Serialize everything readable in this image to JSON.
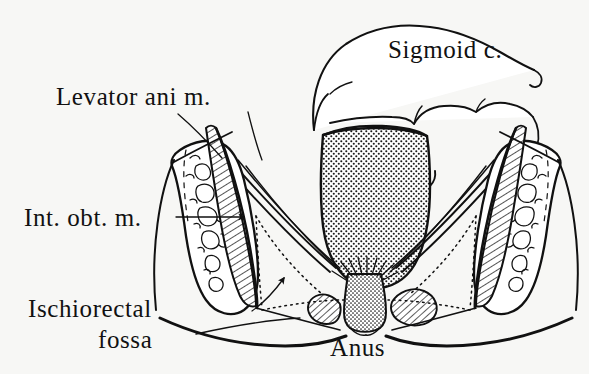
{
  "figure": {
    "style": "hand-drawn anatomical line illustration, black ink on off-white paper",
    "background_color": "#f7f7f5",
    "ink_color": "#111111",
    "width": 589,
    "height": 374
  },
  "labels": {
    "sigmoid": "Sigmoid c.",
    "levator": "Levator ani m.",
    "obturator": "Int. obt. m.",
    "fossa_line1": "Ischiorectal",
    "fossa_line2": "fossa",
    "anus": "Anus"
  },
  "structures": [
    {
      "name": "sigmoid-colon",
      "label": "Sigmoid c.",
      "texture": "outline",
      "description": "Loop of bowel arching over the top of the rectum with haustral indentations"
    },
    {
      "name": "rectal-ampulla",
      "label": "",
      "texture": "stipple",
      "description": "Large stippled oval cavity of the rectum occupying the midline"
    },
    {
      "name": "anal-canal",
      "label": "Anus",
      "texture": "stipple",
      "description": "Narrow stippled column descending from the rectum to the perineal skin"
    },
    {
      "name": "external-anal-sphincter",
      "label": "",
      "texture": "hatch",
      "description": "Paired hatched muscle bundles flanking the anal canal"
    },
    {
      "name": "levator-ani-muscle",
      "label": "Levator ani m.",
      "texture": "line-bands",
      "description": "Thin paired muscle sheets sloping from the pelvic wall down to the anorectal junction"
    },
    {
      "name": "obturator-internus-muscle",
      "label": "Int. obt. m.",
      "texture": "hatch",
      "description": "Diagonally hatched muscle band lying against the inner face of each ischium"
    },
    {
      "name": "ischium-left",
      "label": "",
      "texture": "trabecular",
      "description": "Left ischial bone shown in section with trabecular markings"
    },
    {
      "name": "ischium-right",
      "label": "",
      "texture": "trabecular",
      "description": "Right ischial bone shown in section with trabecular markings"
    },
    {
      "name": "ischiorectal-fossa",
      "label": "Ischiorectal fossa",
      "texture": "dotted-outline",
      "description": "Triangular fat-filled space bounded by dotted lines between levator ani, obturator internus and perineal skin"
    },
    {
      "name": "perineal-skin",
      "label": "",
      "texture": "outline",
      "description": "Heavy curved line forming the skin surface of the perineum"
    }
  ],
  "leaders": [
    {
      "name": "levator-leader-left",
      "from": "Levator ani m.",
      "marker": "none"
    },
    {
      "name": "levator-leader-right",
      "from": "Levator ani m.",
      "marker": "none"
    },
    {
      "name": "obturator-leader",
      "from": "Int. obt. m.",
      "marker": "arrowhead"
    },
    {
      "name": "fossa-leader",
      "from": "fossa",
      "marker": "none"
    },
    {
      "name": "fossa-arrow",
      "from": "Ischiorectal fossa",
      "marker": "arrowhead"
    }
  ]
}
